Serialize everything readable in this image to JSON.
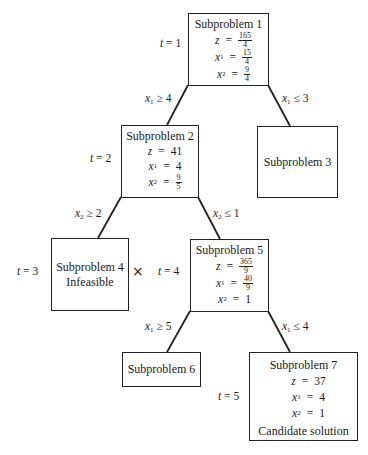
{
  "diagram": {
    "type": "branch-and-bound-tree",
    "nodes": [
      {
        "id": "sp1",
        "title": "Subproblem 1",
        "t_label": "t",
        "t_value": "1",
        "z": {
          "num": "165",
          "den": "4"
        },
        "x1": {
          "num": "15",
          "den": "4"
        },
        "x2": {
          "num": "9",
          "den": "4"
        }
      },
      {
        "id": "sp2",
        "title": "Subproblem 2",
        "t_label": "t",
        "t_value": "2",
        "z": "41",
        "x1": "4",
        "x2": {
          "num": "9",
          "den": "5"
        }
      },
      {
        "id": "sp3",
        "title": "Subproblem 3"
      },
      {
        "id": "sp4",
        "title": "Subproblem 4",
        "t_label": "t",
        "t_value": "3",
        "status": "Infeasible",
        "mark": "×"
      },
      {
        "id": "sp5",
        "title": "Subproblem 5",
        "t_label": "t",
        "t_value": "4",
        "z": {
          "num": "365",
          "den": "9"
        },
        "x1": {
          "num": "40",
          "den": "9"
        },
        "x2": "1"
      },
      {
        "id": "sp6",
        "title": "Subproblem 6"
      },
      {
        "id": "sp7",
        "title": "Subproblem 7",
        "t_label": "t",
        "t_value": "5",
        "z": "37",
        "x1": "4",
        "x2": "1",
        "status": "Candidate solution"
      }
    ],
    "edges": [
      {
        "from": "sp1",
        "to": "sp2",
        "var": "x",
        "sub": "1",
        "op": "≥",
        "value": "4"
      },
      {
        "from": "sp1",
        "to": "sp3",
        "var": "x",
        "sub": "1",
        "op": "≤",
        "value": "3"
      },
      {
        "from": "sp2",
        "to": "sp4",
        "var": "x",
        "sub": "2",
        "op": "≥",
        "value": "2"
      },
      {
        "from": "sp2",
        "to": "sp5",
        "var": "x",
        "sub": "2",
        "op": "≤",
        "value": "1"
      },
      {
        "from": "sp5",
        "to": "sp6",
        "var": "x",
        "sub": "1",
        "op": "≥",
        "value": "5"
      },
      {
        "from": "sp5",
        "to": "sp7",
        "var": "x",
        "sub": "1",
        "op": "≤",
        "value": "4"
      }
    ],
    "symbols": {
      "z": "z",
      "x": "x",
      "sub1": "1",
      "sub2": "2",
      "equals": "=",
      "t": "t"
    }
  }
}
